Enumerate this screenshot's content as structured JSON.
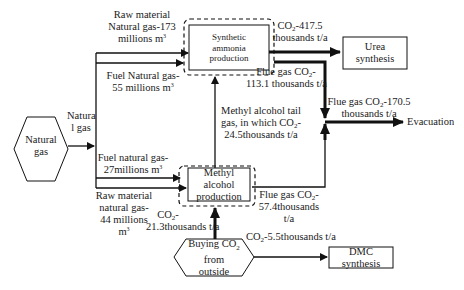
{
  "nodes": {
    "natural_gas": {
      "line1": "Natural",
      "line2": "gas"
    },
    "ammonia": {
      "line1": "Synthetic",
      "line2": "ammonia",
      "line3": "production"
    },
    "methanol": {
      "line1": "Methyl alcohol",
      "line2": "production"
    },
    "urea": {
      "line1": "Urea",
      "line2": "synthesis"
    },
    "evacuation": {
      "label": "Evacuation"
    },
    "buying_co2": {
      "line1": "Buying CO",
      "sub": "2",
      "line2": "from",
      "line3": "outside"
    },
    "dmc": {
      "label": "DMC synthesis"
    }
  },
  "edges": {
    "natural_gas_in": {
      "line1": "Natura",
      "line2": "l gas"
    },
    "raw_ng_ammonia": {
      "line1": "Raw material",
      "line2": "Natural gas-173",
      "line3": "millions m",
      "sup": "3"
    },
    "fuel_ng_ammonia": {
      "line1": "Fuel Natural gas-",
      "line2": "55 millions m",
      "sup": "3"
    },
    "fuel_ng_methanol": {
      "line1": "Fuel natural gas-",
      "line2": "27millions m",
      "sup": "3"
    },
    "raw_ng_methanol": {
      "line1": "Raw material",
      "line2": "natural gas-",
      "line3": "44 millions",
      "line4": "m",
      "sup": "3"
    },
    "co2_to_urea": {
      "pre": "CO",
      "sub": "2",
      "post": "-417.5",
      "line2": "thousands t/a"
    },
    "flue_ammonia": {
      "pre": "Flue gas CO",
      "sub": "2",
      "post": "-",
      "line2": "113.1 thousands t/a"
    },
    "flue_total": {
      "pre": "Flue gas CO",
      "sub": "2",
      "post": "-170.5",
      "line2": "thousands t/a"
    },
    "methanol_tail": {
      "line1": "Methyl alcohol tail",
      "pre": "gas, in which CO",
      "sub": "2",
      "post": "-",
      "line3": "24.5thousands t/a"
    },
    "flue_methanol": {
      "pre": "Flue gas CO",
      "sub": "2",
      "post": "-",
      "line2": "57.4thousands",
      "line3": "t/a"
    },
    "co2_buy_methanol": {
      "pre": "CO",
      "sub": "2",
      "post": "-",
      "line2": "21.3thousands t/a"
    },
    "co2_dmc": {
      "pre": "CO",
      "sub": "2",
      "post": "-5.5thousands t/a"
    }
  },
  "colors": {
    "line": "#111111",
    "background": "#ffffff"
  }
}
